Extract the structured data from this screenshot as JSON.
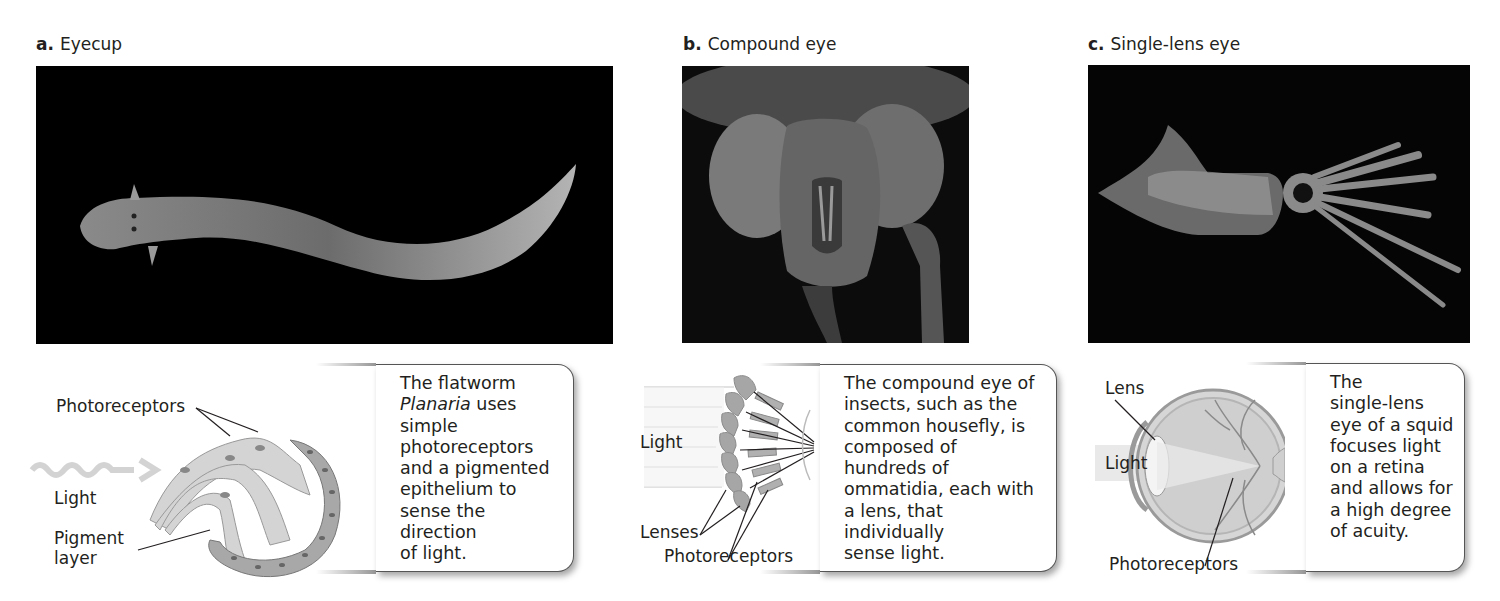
{
  "figure": {
    "panels": [
      {
        "letter": "a.",
        "title": "Eyecup",
        "photo_subject": "flatworm (Planaria)",
        "diagram_labels": {
          "photoreceptors": "Photoreceptors",
          "light": "Light",
          "pigment_line1": "Pigment",
          "pigment_line2": "layer"
        },
        "caption": {
          "line1": "The flatworm",
          "italic": "Planaria",
          "line2_rest": " uses",
          "line3": "simple",
          "line4": "photoreceptors",
          "line5": "and a pigmented",
          "line6": "epithelium to",
          "line7": "sense the direction",
          "line8": "of light."
        }
      },
      {
        "letter": "b.",
        "title": "Compound eye",
        "photo_subject": "housefly head (SEM)",
        "diagram_labels": {
          "light": "Light",
          "lenses": "Lenses",
          "photoreceptors": "Photoreceptors"
        },
        "caption": {
          "line1": "The compound eye of",
          "line2": "insects, such as the",
          "line3": "common housefly, is",
          "line4": "composed of",
          "line5": "hundreds of",
          "line6": "ommatidia, each with",
          "line7": "a lens, that individually",
          "line8": "sense light."
        }
      },
      {
        "letter": "c.",
        "title": "Single-lens eye",
        "photo_subject": "squid",
        "diagram_labels": {
          "lens": "Lens",
          "light": "Light",
          "photoreceptors": "Photoreceptors"
        },
        "caption": {
          "line1": "The",
          "line2": "single-lens",
          "line3": "eye of a squid",
          "line4": "focuses light",
          "line5": "on a retina",
          "line6": "and allows for",
          "line7": "a high degree",
          "line8": "of acuity."
        }
      }
    ]
  }
}
